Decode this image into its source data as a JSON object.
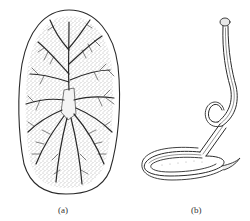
{
  "figure": {
    "panels": [
      {
        "id": "a",
        "label": "(a)",
        "subject": "oval flatworm with branching gut (dotted stipple body)"
      },
      {
        "id": "b",
        "label": "(b)",
        "subject": "elongated coiled worm with knobbed head"
      }
    ]
  },
  "colors": {
    "background": "#ffffff",
    "ink": "#2a2a2a",
    "stipple": "#555555"
  }
}
